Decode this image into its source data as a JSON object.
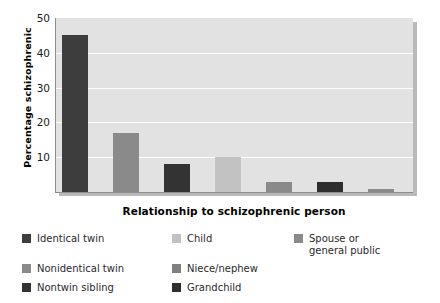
{
  "chart_data": {
    "type": "bar",
    "title": "",
    "xlabel": "Relationship to schizophrenic person",
    "ylabel": "Percentage schizophrenic",
    "categories": [
      "Identical twin",
      "Nonidentical twin",
      "Nontwin sibling",
      "Child",
      "Niece/nephew",
      "Grandchild",
      "Spouse or general public"
    ],
    "values": [
      45,
      17,
      8,
      10,
      3,
      3,
      1
    ],
    "ylim": [
      0,
      50
    ],
    "yticks": [
      10,
      20,
      30,
      40,
      50
    ],
    "ytick_labels": [
      "10",
      "20",
      "30",
      "40",
      "50"
    ],
    "grid": true,
    "grid_color": "#fdfdfd",
    "plot_background": "#e2e2e2",
    "legend_position": "below",
    "bar_colors": [
      "#3d3d3d",
      "#8a8a8a",
      "#333333",
      "#c2c2c2",
      "#8a8a8a",
      "#2e2e2e",
      "#8a8a8a"
    ]
  },
  "axes": {
    "y_title": "Percentage schizophrenic",
    "x_title": "Relationship to schizophrenic person",
    "y_ticks": [
      {
        "label": "50",
        "value": 50
      },
      {
        "label": "40",
        "value": 40
      },
      {
        "label": "30",
        "value": 30
      },
      {
        "label": "20",
        "value": 20
      },
      {
        "label": "10",
        "value": 10
      }
    ]
  },
  "legend": {
    "rows": [
      [
        {
          "label": "Identical twin",
          "color": "#3d3d3d"
        },
        {
          "label": "Child",
          "color": "#c2c2c2"
        },
        {
          "label": "Spouse or\ngeneral public",
          "color": "#8a8a8a"
        }
      ],
      [
        {
          "label": "Nonidentical twin",
          "color": "#8a8a8a"
        },
        {
          "label": "Niece/nephew",
          "color": "#7f7f7f"
        },
        {
          "label": "",
          "color": ""
        }
      ],
      [
        {
          "label": "Nontwin sibling",
          "color": "#333333"
        },
        {
          "label": "Grandchild",
          "color": "#2e2e2e"
        },
        {
          "label": "",
          "color": ""
        }
      ]
    ]
  }
}
